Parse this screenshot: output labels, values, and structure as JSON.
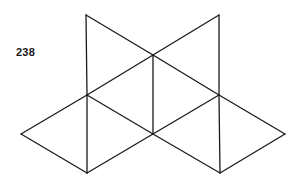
{
  "figure": {
    "label": "238",
    "stroke_color": "#1a1a1a",
    "background_color": "#ffffff"
  },
  "vertices": {
    "A": [
      86,
      15
    ],
    "B": [
      219,
      15
    ],
    "C": [
      153,
      55
    ],
    "D": [
      87,
      95
    ],
    "E": [
      219,
      95
    ],
    "F": [
      153,
      134
    ],
    "G": [
      21,
      134
    ],
    "H": [
      285,
      134
    ],
    "I": [
      87,
      173
    ],
    "J": [
      220,
      173
    ]
  },
  "edges": [
    [
      "A",
      "C"
    ],
    [
      "A",
      "D"
    ],
    [
      "B",
      "C"
    ],
    [
      "B",
      "E"
    ],
    [
      "C",
      "D"
    ],
    [
      "C",
      "E"
    ],
    [
      "C",
      "F"
    ],
    [
      "D",
      "F"
    ],
    [
      "D",
      "G"
    ],
    [
      "D",
      "I"
    ],
    [
      "E",
      "F"
    ],
    [
      "E",
      "H"
    ],
    [
      "E",
      "J"
    ],
    [
      "F",
      "I"
    ],
    [
      "F",
      "J"
    ],
    [
      "G",
      "I"
    ],
    [
      "H",
      "J"
    ]
  ]
}
